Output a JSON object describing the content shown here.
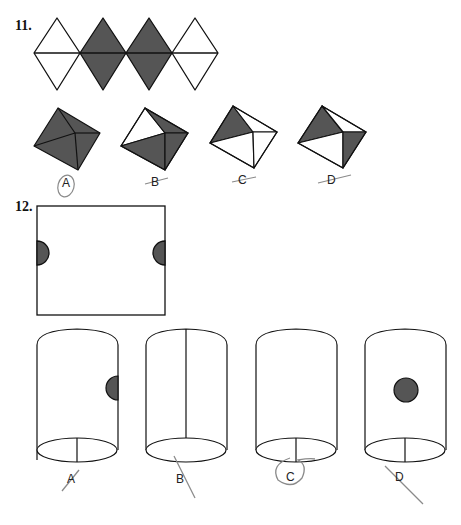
{
  "questions": [
    {
      "number": "11.",
      "net": {
        "diamonds": [
          {
            "shaded": false
          },
          {
            "shaded": true
          },
          {
            "shaded": true
          },
          {
            "shaded": false
          }
        ]
      },
      "options": [
        {
          "label": "A",
          "mark": "circled"
        },
        {
          "label": "B",
          "mark": "crossed"
        },
        {
          "label": "C",
          "mark": "crossed"
        },
        {
          "label": "D",
          "mark": "crossed"
        }
      ]
    },
    {
      "number": "12.",
      "sheet": {
        "semicircles": [
          "left-edge",
          "right-edge"
        ]
      },
      "options": [
        {
          "label": "A",
          "mark": "crossed"
        },
        {
          "label": "B",
          "mark": "crossed"
        },
        {
          "label": "C",
          "mark": "circled"
        },
        {
          "label": "D",
          "mark": "crossed"
        }
      ]
    }
  ],
  "colors": {
    "shade": "#555555",
    "line": "#111111",
    "pencil": "#8a8a8a"
  }
}
